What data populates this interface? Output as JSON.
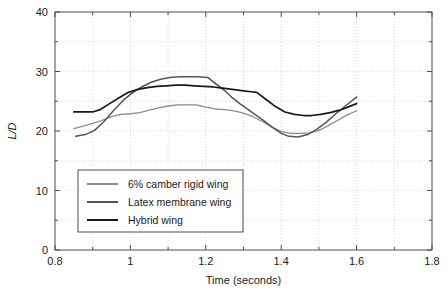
{
  "chart_data": {
    "type": "line",
    "title": "",
    "xlabel": "Time (seconds)",
    "ylabel": "L/D",
    "xlim": [
      0.8,
      1.8
    ],
    "ylim": [
      0,
      40
    ],
    "grid": true,
    "legend_position": "lower-left-inside",
    "xticks": [
      0.8,
      1.0,
      1.2,
      1.4,
      1.6,
      1.8
    ],
    "xtick_labels": [
      "0.8",
      "1",
      "1.2",
      "1.4",
      "1.6",
      "1.8"
    ],
    "xminor_ticks": [
      0.9,
      1.1,
      1.3,
      1.5,
      1.7
    ],
    "yticks": [
      0,
      10,
      20,
      30,
      40
    ],
    "ytick_labels": [
      "0",
      "10",
      "20",
      "30",
      "40"
    ],
    "yminor_ticks": [
      5,
      15,
      25,
      35
    ],
    "xgridlines": [
      0.9,
      1.0,
      1.1,
      1.2,
      1.3,
      1.4,
      1.5,
      1.6,
      1.7
    ],
    "ygridlines": [
      5,
      10,
      15,
      20,
      25,
      30,
      35
    ],
    "series": [
      {
        "name": "6% camber rigid wing",
        "color": "#8c8c8c",
        "width": 1.3,
        "x": [
          0.85,
          0.875,
          0.9,
          0.925,
          0.95,
          0.975,
          1.0,
          1.025,
          1.05,
          1.075,
          1.1,
          1.125,
          1.15,
          1.175,
          1.2,
          1.225,
          1.25,
          1.275,
          1.3,
          1.325,
          1.35,
          1.375,
          1.4,
          1.425,
          1.45,
          1.475,
          1.5,
          1.525,
          1.55,
          1.575,
          1.6
        ],
        "y": [
          20.4,
          20.8,
          21.3,
          21.8,
          22.4,
          22.8,
          22.9,
          23.1,
          23.5,
          23.9,
          24.2,
          24.4,
          24.4,
          24.4,
          24.0,
          23.7,
          23.6,
          23.4,
          23.0,
          22.4,
          21.6,
          20.7,
          19.9,
          19.6,
          19.6,
          19.7,
          20.1,
          20.9,
          21.8,
          22.7,
          23.4
        ]
      },
      {
        "name": "Latex membrane wing",
        "color": "#555555",
        "width": 1.5,
        "x": [
          0.855,
          0.88,
          0.905,
          0.93,
          0.955,
          0.98,
          1.005,
          1.03,
          1.055,
          1.08,
          1.105,
          1.13,
          1.155,
          1.18,
          1.205,
          1.225,
          1.25,
          1.27,
          1.29,
          1.31,
          1.33,
          1.35,
          1.375,
          1.4,
          1.42,
          1.445,
          1.47,
          1.495,
          1.52,
          1.545,
          1.57,
          1.6
        ],
        "y": [
          19.1,
          19.4,
          20.1,
          21.6,
          23.4,
          25.1,
          26.4,
          27.4,
          28.2,
          28.7,
          29.0,
          29.1,
          29.1,
          29.1,
          29.0,
          28.0,
          26.8,
          25.6,
          24.6,
          23.7,
          22.8,
          21.9,
          20.7,
          19.6,
          19.1,
          19.0,
          19.4,
          20.3,
          21.5,
          22.9,
          24.2,
          25.7
        ]
      },
      {
        "name": "Hybrid wing",
        "color": "#1a1a1a",
        "width": 1.7,
        "x": [
          0.85,
          0.875,
          0.9,
          0.92,
          0.945,
          0.97,
          0.995,
          1.02,
          1.045,
          1.07,
          1.095,
          1.12,
          1.145,
          1.17,
          1.195,
          1.22,
          1.245,
          1.27,
          1.295,
          1.32,
          1.335,
          1.36,
          1.385,
          1.41,
          1.435,
          1.46,
          1.48,
          1.505,
          1.53,
          1.555,
          1.58,
          1.6
        ],
        "y": [
          23.2,
          23.2,
          23.2,
          23.6,
          24.6,
          25.6,
          26.5,
          27.0,
          27.3,
          27.5,
          27.6,
          27.7,
          27.7,
          27.6,
          27.5,
          27.4,
          27.2,
          27.0,
          26.8,
          26.6,
          26.5,
          25.3,
          24.1,
          23.2,
          22.8,
          22.6,
          22.6,
          22.8,
          23.1,
          23.5,
          24.1,
          24.6
        ]
      }
    ]
  },
  "watermarks": [
    "",
    ""
  ]
}
